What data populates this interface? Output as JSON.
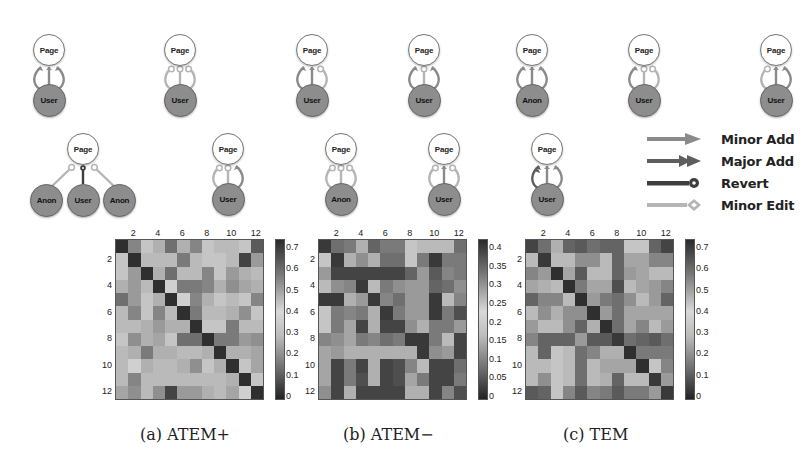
{
  "motifs": {
    "row1": [
      {
        "top": "Page",
        "bottom": "User",
        "edges": [
          "minor-add",
          "minor-add",
          "minor-add"
        ]
      },
      {
        "top": "Page",
        "bottom": "User",
        "edges": [
          "minor-edit",
          "minor-edit",
          "minor-edit"
        ]
      },
      {
        "top": "Page",
        "bottom": "User",
        "edges": [
          "minor-add",
          "minor-add",
          "minor-edit"
        ]
      },
      {
        "top": "Page",
        "bottom": "User",
        "edges": [
          "minor-add",
          "minor-edit",
          "minor-add"
        ]
      },
      {
        "top": "Page",
        "bottom": "Anon",
        "edges": [
          "minor-add",
          "minor-add",
          "minor-add"
        ]
      },
      {
        "top": "Page",
        "bottom": "User",
        "edges": [
          "minor-add",
          "minor-edit",
          "minor-edit"
        ]
      },
      {
        "top": "Page",
        "bottom": "User",
        "edges": [
          "minor-edit",
          "minor-add",
          "minor-add"
        ]
      }
    ],
    "row2": [
      {
        "top": "Page",
        "bottoms": [
          "Anon",
          "User",
          "Anon"
        ],
        "edges": [
          "minor-edit",
          "revert",
          "minor-edit"
        ]
      },
      {
        "top": "Page",
        "bottom": "User",
        "edges": [
          "minor-edit",
          "minor-edit",
          "minor-add"
        ]
      },
      {
        "top": "Page",
        "bottom": "Anon",
        "edges": [
          "minor-edit",
          "minor-edit",
          "minor-edit"
        ]
      },
      {
        "top": "Page",
        "bottom": "User",
        "edges": [
          "minor-edit",
          "minor-add",
          "minor-edit"
        ]
      },
      {
        "top": "Page",
        "bottom": "User",
        "edges": [
          "major-add",
          "minor-add",
          "minor-add"
        ]
      }
    ]
  },
  "legend": {
    "items": [
      {
        "label": "Minor Add",
        "type": "minor-add",
        "color": "#8a8a8a"
      },
      {
        "label": "Major Add",
        "type": "major-add",
        "color": "#5e5e5e"
      },
      {
        "label": "Revert",
        "type": "revert",
        "color": "#3e3e3e"
      },
      {
        "label": "Minor Edit",
        "type": "minor-edit",
        "color": "#b5b5b5"
      }
    ]
  },
  "captions": {
    "a": "(a) ATEM+",
    "b": "(b) ATEM−",
    "c": "(c) TEM"
  },
  "chart_data": [
    {
      "type": "heatmap",
      "title": "(a) ATEM+",
      "x_ticks": [
        "2",
        "4",
        "6",
        "8",
        "10",
        "12"
      ],
      "y_ticks": [
        "2",
        "4",
        "6",
        "8",
        "10",
        "12"
      ],
      "size": 12,
      "colorbar": {
        "ticks": [
          "0.7",
          "0.6",
          "0.5",
          "0.4",
          "0.3",
          "0.2",
          "0.1",
          "0"
        ],
        "range": [
          0,
          0.75
        ]
      },
      "gray_intensity": [
        [
          0.1,
          0.5,
          0.8,
          0.7,
          0.4,
          0.7,
          0.5,
          0.8,
          0.75,
          0.75,
          0.8,
          0.3
        ],
        [
          0.8,
          0.1,
          0.75,
          0.75,
          0.75,
          0.45,
          0.75,
          0.8,
          0.8,
          0.75,
          0.2,
          0.6
        ],
        [
          0.8,
          0.6,
          0.1,
          0.7,
          0.4,
          0.75,
          0.75,
          0.5,
          0.8,
          0.6,
          0.7,
          0.75
        ],
        [
          0.7,
          0.6,
          0.75,
          0.1,
          0.85,
          0.45,
          0.45,
          0.5,
          0.7,
          0.55,
          0.65,
          0.7
        ],
        [
          0.4,
          0.6,
          0.8,
          0.7,
          0.1,
          0.85,
          0.5,
          0.7,
          0.8,
          0.75,
          0.8,
          0.5
        ],
        [
          0.75,
          0.5,
          0.8,
          0.5,
          0.75,
          0.1,
          0.45,
          0.75,
          0.75,
          0.7,
          0.55,
          0.8
        ],
        [
          0.75,
          0.75,
          0.7,
          0.6,
          0.7,
          0.7,
          0.1,
          0.8,
          0.8,
          0.45,
          0.75,
          0.75
        ],
        [
          0.8,
          0.55,
          0.7,
          0.65,
          0.8,
          0.4,
          0.4,
          0.1,
          0.45,
          0.45,
          0.6,
          0.55
        ],
        [
          0.75,
          0.7,
          0.45,
          0.7,
          0.7,
          0.75,
          0.75,
          0.7,
          0.1,
          0.7,
          0.7,
          0.65
        ],
        [
          0.75,
          0.85,
          0.7,
          0.75,
          0.75,
          0.7,
          0.55,
          0.8,
          0.7,
          0.1,
          0.8,
          0.65
        ],
        [
          0.75,
          0.5,
          0.75,
          0.75,
          0.75,
          0.75,
          0.75,
          0.75,
          0.75,
          0.7,
          0.1,
          0.8
        ],
        [
          0.65,
          0.55,
          0.75,
          0.55,
          0.2,
          0.6,
          0.6,
          0.7,
          0.75,
          0.65,
          0.85,
          0.1
        ]
      ]
    },
    {
      "type": "heatmap",
      "title": "(b) ATEM−",
      "x_ticks": [
        "2",
        "4",
        "6",
        "8",
        "10",
        "12"
      ],
      "y_ticks": [
        "2",
        "4",
        "6",
        "8",
        "10",
        "12"
      ],
      "size": 12,
      "colorbar": {
        "ticks": [
          "0.4",
          "0.35",
          "0.3",
          "0.25",
          "0.2",
          "0.15",
          "0.1",
          "0.05",
          "0"
        ],
        "range": [
          -0.02,
          0.4
        ]
      },
      "gray_intensity": [
        [
          0.15,
          0.4,
          0.45,
          0.7,
          0.35,
          0.45,
          0.45,
          0.8,
          0.75,
          0.75,
          0.75,
          0.4
        ],
        [
          0.8,
          0.15,
          0.7,
          0.55,
          0.7,
          0.4,
          0.4,
          0.8,
          0.45,
          0.15,
          0.45,
          0.45
        ],
        [
          0.6,
          0.2,
          0.2,
          0.2,
          0.2,
          0.2,
          0.2,
          0.35,
          0.6,
          0.3,
          0.5,
          0.45
        ],
        [
          0.75,
          0.55,
          0.5,
          0.15,
          0.75,
          0.45,
          0.55,
          0.6,
          0.6,
          0.35,
          0.4,
          0.55
        ],
        [
          0.15,
          0.15,
          0.7,
          0.6,
          0.15,
          0.5,
          0.4,
          0.6,
          0.6,
          0.15,
          0.75,
          0.5
        ],
        [
          0.8,
          0.45,
          0.5,
          0.45,
          0.7,
          0.15,
          0.45,
          0.6,
          0.6,
          0.15,
          0.45,
          0.25
        ],
        [
          0.8,
          0.45,
          0.65,
          0.2,
          0.7,
          0.2,
          0.2,
          0.55,
          0.7,
          0.45,
          0.45,
          0.6
        ],
        [
          0.5,
          0.55,
          0.65,
          0.45,
          0.5,
          0.4,
          0.45,
          0.15,
          0.15,
          0.45,
          0.75,
          0.2
        ],
        [
          0.65,
          0.6,
          0.7,
          0.7,
          0.7,
          0.7,
          0.7,
          0.7,
          0.15,
          0.55,
          0.6,
          0.2
        ],
        [
          0.65,
          0.2,
          0.45,
          0.2,
          0.7,
          0.2,
          0.25,
          0.5,
          0.75,
          0.2,
          0.2,
          0.4
        ],
        [
          0.65,
          0.2,
          0.45,
          0.25,
          0.7,
          0.2,
          0.25,
          0.65,
          0.45,
          0.2,
          0.2,
          0.45
        ],
        [
          0.55,
          0.2,
          0.7,
          0.2,
          0.2,
          0.2,
          0.2,
          0.7,
          0.7,
          0.2,
          0.5,
          0.25
        ]
      ]
    },
    {
      "type": "heatmap",
      "title": "(c) TEM",
      "x_ticks": [
        "2",
        "4",
        "6",
        "8",
        "10",
        "12"
      ],
      "y_ticks": [
        "2",
        "4",
        "6",
        "8",
        "10",
        "12"
      ],
      "size": 12,
      "colorbar": {
        "ticks": [
          "0.7",
          "0.6",
          "0.5",
          "0.4",
          "0.3",
          "0.2",
          "0.1",
          "0"
        ],
        "range": [
          0,
          0.75
        ]
      },
      "gray_intensity": [
        [
          0.2,
          0.4,
          0.7,
          0.35,
          0.3,
          0.4,
          0.35,
          0.35,
          0.8,
          0.8,
          0.35,
          0.2
        ],
        [
          0.75,
          0.15,
          0.75,
          0.75,
          0.55,
          0.55,
          0.75,
          0.35,
          0.65,
          0.65,
          0.5,
          0.5
        ],
        [
          0.5,
          0.6,
          0.1,
          0.65,
          0.3,
          0.75,
          0.75,
          0.35,
          0.6,
          0.65,
          0.75,
          0.75
        ],
        [
          0.65,
          0.7,
          0.75,
          0.1,
          0.45,
          0.65,
          0.65,
          0.25,
          0.75,
          0.65,
          0.6,
          0.5
        ],
        [
          0.35,
          0.5,
          0.5,
          0.75,
          0.1,
          0.6,
          0.45,
          0.4,
          0.55,
          0.75,
          0.6,
          0.35
        ],
        [
          0.75,
          0.55,
          0.7,
          0.55,
          0.55,
          0.1,
          0.6,
          0.4,
          0.65,
          0.65,
          0.65,
          0.65
        ],
        [
          0.6,
          0.75,
          0.75,
          0.55,
          0.35,
          0.7,
          0.1,
          0.4,
          0.65,
          0.5,
          0.75,
          0.6
        ],
        [
          0.5,
          0.35,
          0.35,
          0.35,
          0.6,
          0.3,
          0.3,
          0.15,
          0.4,
          0.35,
          0.3,
          0.4
        ],
        [
          0.75,
          0.35,
          0.8,
          0.75,
          0.4,
          0.5,
          0.7,
          0.7,
          0.1,
          0.45,
          0.45,
          0.45
        ],
        [
          0.75,
          0.75,
          0.8,
          0.75,
          0.4,
          0.75,
          0.65,
          0.65,
          0.65,
          0.1,
          0.8,
          0.5
        ],
        [
          0.75,
          0.55,
          0.8,
          0.75,
          0.4,
          0.75,
          0.7,
          0.35,
          0.75,
          0.75,
          0.15,
          0.6
        ],
        [
          0.3,
          0.35,
          0.8,
          0.5,
          0.3,
          0.5,
          0.45,
          0.3,
          0.45,
          0.45,
          0.6,
          0.15
        ]
      ]
    }
  ]
}
